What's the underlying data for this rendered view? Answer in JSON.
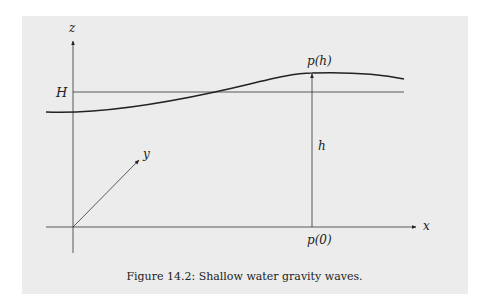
{
  "figure": {
    "caption": "Figure 14.2: Shallow water gravity waves.",
    "labels": {
      "z_axis": "z",
      "x_axis": "x",
      "y_axis": "y",
      "mean_depth": "H",
      "height": "h",
      "top_point": "p(h)",
      "bottom_point": "p(0)"
    },
    "colors": {
      "background": "#ececec",
      "stroke": "#222222"
    }
  }
}
